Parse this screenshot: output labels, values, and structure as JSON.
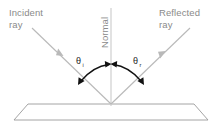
{
  "diagram": {
    "canvas": {
      "width": 219,
      "height": 127,
      "background": "#ffffff"
    },
    "labels": {
      "incident_line1": "Incident",
      "incident_line2": "ray",
      "reflected_line1": "Reflected",
      "reflected_line2": "ray",
      "normal": "Normal",
      "angle_incidence_symbol": "θ",
      "angle_incidence_subscript": "i",
      "angle_reflection_symbol": "θ",
      "angle_reflection_subscript": "r"
    },
    "colors": {
      "ray": "#b9b9b9",
      "normal_line": "#cfcfcf",
      "mirror_outline": "#9a9a9a",
      "mirror_fill": "#ffffff",
      "arc_arrow": "#111111",
      "label_text": "#8a8a8a",
      "angle_text": "#1a1a1a",
      "background": "#ffffff"
    },
    "geometry": {
      "vertex_x": 111,
      "vertex_y": 104,
      "incident_start_x": 32,
      "incident_start_y": 28,
      "reflected_end_x": 190,
      "reflected_end_y": 28,
      "normal_top_y": 8,
      "normal_bottom_y": 106,
      "mirror_top_left_x": 28,
      "mirror_top_right_x": 194,
      "mirror_top_y": 104,
      "mirror_bottom_left_x": 14,
      "mirror_bottom_right_x": 208,
      "mirror_bottom_y": 120
    }
  }
}
